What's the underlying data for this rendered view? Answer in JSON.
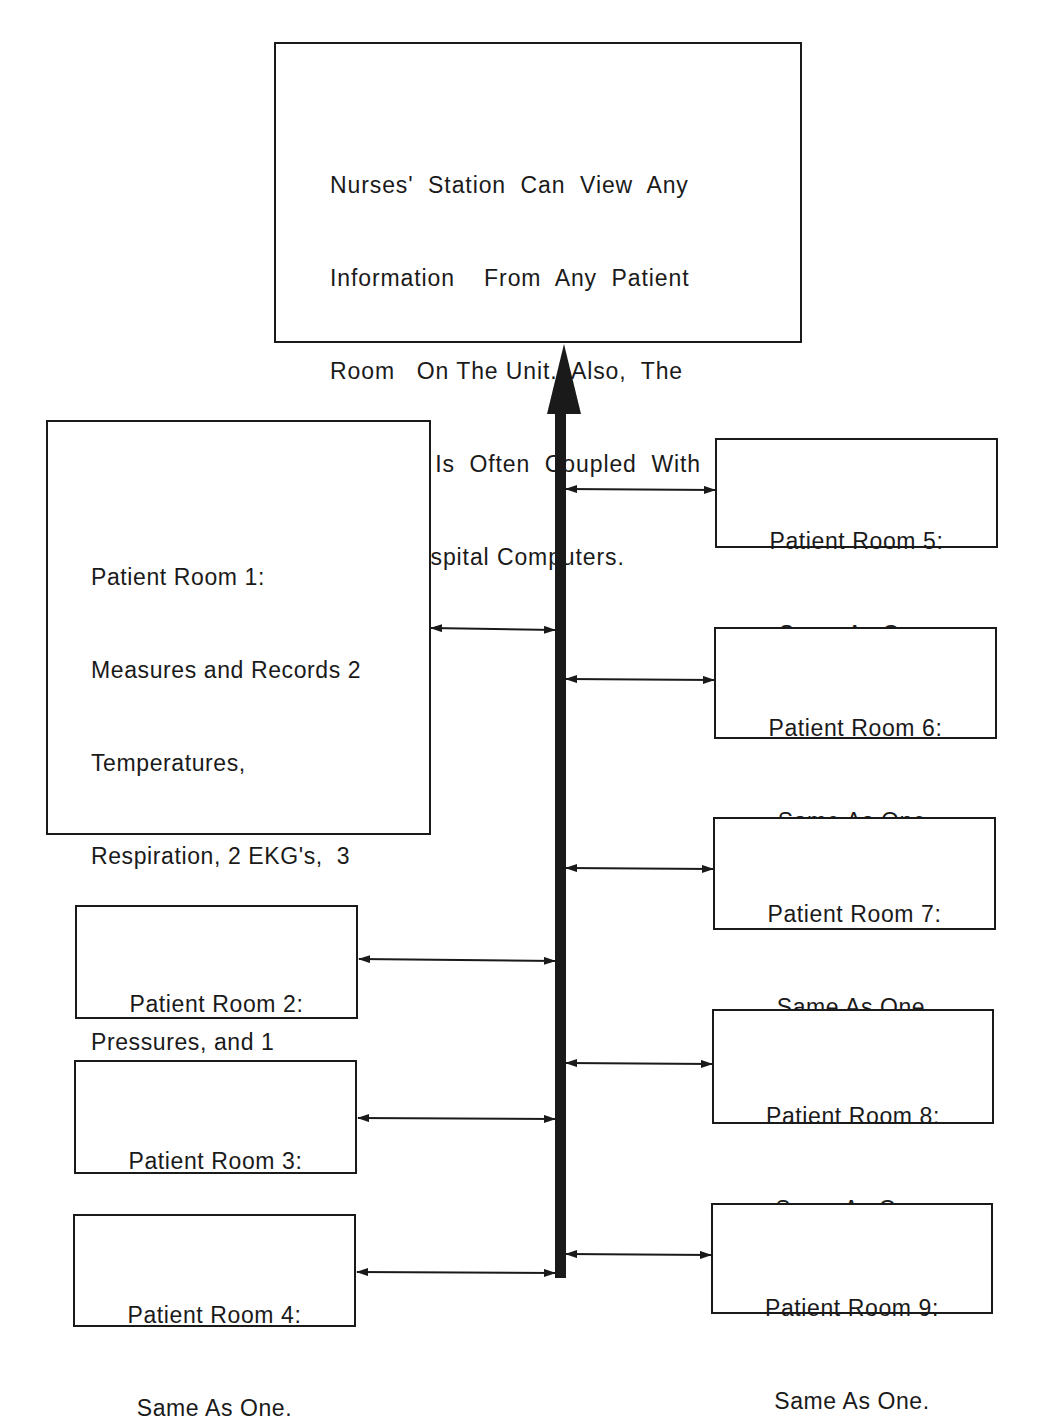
{
  "nurses_station": {
    "lines": [
      "Nurses'  Station  Can  View  Any",
      "Information    From  Any  Patient",
      "Room   On The Unit.  Also,  The",
      "Network  Is  Often  Coupled  With",
      "Other Hospital Computers."
    ]
  },
  "rooms": [
    {
      "id": 1,
      "lines": [
        "Patient Room 1:",
        "Measures and Records 2",
        "Temperatures,",
        "Respiration, 2 EKG's,  3",
        "Invasive Blood",
        "Pressures, and 1",
        "Non-invasive Blood",
        "Pressure."
      ]
    },
    {
      "id": 2,
      "lines": [
        "Patient Room 2:",
        "Same As One."
      ]
    },
    {
      "id": 3,
      "lines": [
        "Patient Room 3:",
        "Same As One."
      ]
    },
    {
      "id": 4,
      "lines": [
        "Patient Room 4:",
        "Same As One."
      ]
    },
    {
      "id": 5,
      "lines": [
        "Patient Room 5:",
        "Same As One."
      ]
    },
    {
      "id": 6,
      "lines": [
        "Patient Room 6:",
        "Same As One."
      ]
    },
    {
      "id": 7,
      "lines": [
        "Patient Room 7:",
        "Same As One."
      ]
    },
    {
      "id": 8,
      "lines": [
        "Patient Room 8:",
        "Same As One."
      ]
    },
    {
      "id": 9,
      "lines": [
        "Patient Room 9:",
        "Same As One."
      ]
    }
  ],
  "colors": {
    "ink": "#1a1a1a",
    "background": "#ffffff"
  }
}
